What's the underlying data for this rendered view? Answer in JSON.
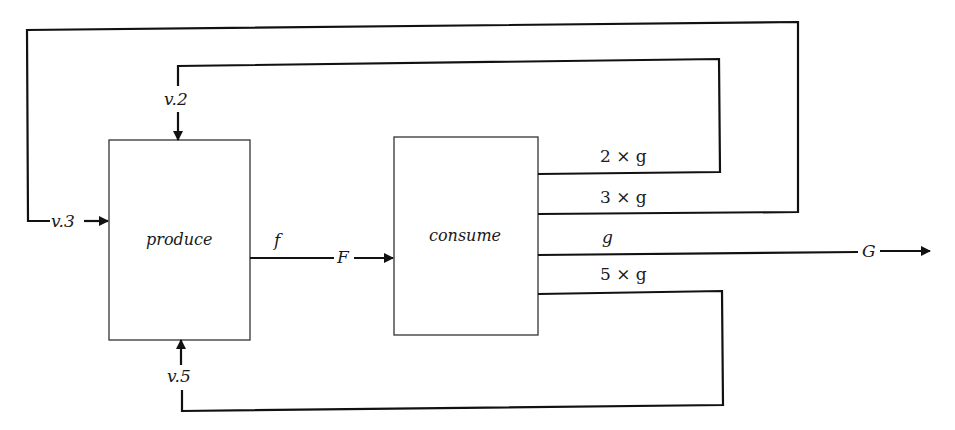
{
  "nodes": {
    "produce": {
      "label": "produce"
    },
    "consume": {
      "label": "consume"
    }
  },
  "edges": {
    "v2": {
      "label": "v.2"
    },
    "v3": {
      "label": "v.3"
    },
    "v5": {
      "label": "v.5"
    },
    "f_out": {
      "label": "f"
    },
    "F_in": {
      "label": "F"
    },
    "out_2g": {
      "label": "2 × g"
    },
    "out_3g": {
      "label": "3 × g"
    },
    "out_g": {
      "label": "g"
    },
    "out_5g": {
      "label": "5 × g"
    },
    "G_out": {
      "label": "G"
    }
  },
  "colors": {
    "line": "#111111",
    "box": "#333333",
    "background": "#ffffff"
  }
}
